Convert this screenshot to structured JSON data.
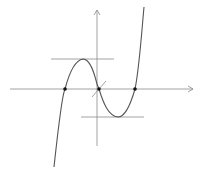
{
  "diagram": {
    "type": "cubic-function-graph",
    "colors": {
      "background": "#ffffff",
      "axis": "#8a8a8a",
      "curve": "#555555",
      "tangent": "#8a8a8a",
      "point": "#111111"
    },
    "axes": {
      "x_axis": {
        "x1": 10,
        "y": 89,
        "x2": 193
      },
      "y_axis": {
        "x": 97,
        "y1": 10,
        "y2": 146
      }
    },
    "curve_path": "M 54 167 C 58 130, 62 95, 65 89 C 70 70, 76 60, 83 59 C 90 59, 94 72, 97 84 L 99 89 C 103 102, 108 116, 118 117 C 125 117, 131 103, 135 89 C 139 70, 141 40, 144 7",
    "tangents": [
      {
        "name": "local-max-tangent",
        "x1": 51,
        "y1": 59,
        "x2": 114,
        "y2": 59
      },
      {
        "name": "local-min-tangent",
        "x1": 81,
        "y1": 117,
        "x2": 144,
        "y2": 117
      },
      {
        "name": "inflection-tangent",
        "x1": 92,
        "y1": 97,
        "x2": 106,
        "y2": 81
      }
    ],
    "points": [
      {
        "name": "x-intercept-left",
        "cx": 65,
        "cy": 89
      },
      {
        "name": "x-intercept-origin",
        "cx": 99,
        "cy": 89
      },
      {
        "name": "x-intercept-right",
        "cx": 135,
        "cy": 89
      }
    ]
  }
}
